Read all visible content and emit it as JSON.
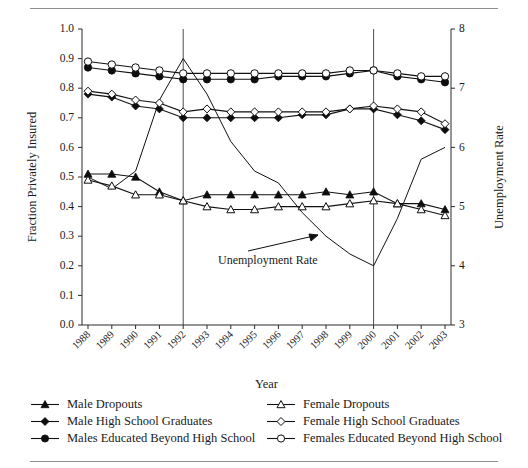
{
  "figure": {
    "rules": [
      "top-rule",
      "bottom-rule"
    ]
  },
  "chart_data": {
    "type": "line",
    "title": "",
    "xlabel": "Year",
    "ylabel": "Fraction Privately Insured",
    "y2label": "Unemployment Rate",
    "grid": false,
    "legend_position": "below",
    "categories": [
      "1988",
      "1989",
      "1990",
      "1991",
      "1992",
      "1993",
      "1994",
      "1995",
      "1996",
      "1997",
      "1998",
      "1999",
      "2000",
      "2001",
      "2002",
      "2003"
    ],
    "ylim": [
      0.0,
      1.0
    ],
    "yticks": [
      "0.0",
      "0.1",
      "0.2",
      "0.3",
      "0.4",
      "0.5",
      "0.6",
      "0.7",
      "0.8",
      "0.9",
      "1.0"
    ],
    "y2lim": [
      3,
      8
    ],
    "y2ticks": [
      "3",
      "4",
      "5",
      "6",
      "7",
      "8"
    ],
    "reference_lines": [
      {
        "name": "vline-1992",
        "x": "1992"
      },
      {
        "name": "vline-2000",
        "x": "2000"
      }
    ],
    "annotations": [
      {
        "name": "unemployment-rate-annotation",
        "text": "Unemployment Rate",
        "points_to": "1999"
      }
    ],
    "series": [
      {
        "name": "Male Dropouts",
        "key": "male-dropouts",
        "marker": "filled-triangle",
        "axis": "left",
        "values": [
          0.51,
          0.51,
          0.5,
          0.45,
          0.42,
          0.44,
          0.44,
          0.44,
          0.44,
          0.44,
          0.45,
          0.44,
          0.45,
          0.41,
          0.41,
          0.39
        ]
      },
      {
        "name": "Male High School Graduates",
        "key": "male-hs-graduates",
        "marker": "filled-diamond",
        "axis": "left",
        "values": [
          0.78,
          0.77,
          0.74,
          0.73,
          0.7,
          0.7,
          0.7,
          0.7,
          0.7,
          0.71,
          0.71,
          0.73,
          0.73,
          0.71,
          0.69,
          0.66
        ]
      },
      {
        "name": "Males Educated Beyond High School",
        "key": "males-beyond-hs",
        "marker": "filled-circle",
        "axis": "left",
        "values": [
          0.87,
          0.86,
          0.85,
          0.84,
          0.83,
          0.83,
          0.83,
          0.83,
          0.84,
          0.84,
          0.84,
          0.85,
          0.86,
          0.84,
          0.83,
          0.82
        ]
      },
      {
        "name": "Female Dropouts",
        "key": "female-dropouts",
        "marker": "open-triangle",
        "axis": "left",
        "values": [
          0.49,
          0.47,
          0.44,
          0.44,
          0.42,
          0.4,
          0.39,
          0.39,
          0.4,
          0.4,
          0.4,
          0.41,
          0.42,
          0.41,
          0.39,
          0.37
        ]
      },
      {
        "name": "Female High School Graduates",
        "key": "female-hs-graduates",
        "marker": "open-diamond",
        "axis": "left",
        "values": [
          0.79,
          0.78,
          0.76,
          0.75,
          0.72,
          0.73,
          0.72,
          0.72,
          0.72,
          0.72,
          0.72,
          0.73,
          0.74,
          0.73,
          0.72,
          0.68
        ]
      },
      {
        "name": "Females Educated Beyond High School",
        "key": "females-beyond-hs",
        "marker": "open-circle",
        "axis": "left",
        "values": [
          0.89,
          0.88,
          0.87,
          0.86,
          0.85,
          0.85,
          0.85,
          0.85,
          0.85,
          0.85,
          0.85,
          0.86,
          0.86,
          0.85,
          0.84,
          0.84
        ]
      },
      {
        "name": "Unemployment Rate",
        "key": "unemployment-rate",
        "marker": "none",
        "axis": "right",
        "values": [
          5.5,
          5.3,
          5.6,
          6.8,
          7.5,
          6.9,
          6.1,
          5.6,
          5.4,
          4.9,
          4.5,
          4.2,
          4.0,
          4.8,
          5.8,
          6.0
        ]
      }
    ]
  },
  "legend": {
    "items": [
      {
        "label": "Male Dropouts",
        "marker": "filled-triangle",
        "key": "male-dropouts"
      },
      {
        "label": "Female Dropouts",
        "marker": "open-triangle",
        "key": "female-dropouts"
      },
      {
        "label": "Male High School Graduates",
        "marker": "filled-diamond",
        "key": "male-hs-graduates"
      },
      {
        "label": "Female High School Graduates",
        "marker": "open-diamond",
        "key": "female-hs-graduates"
      },
      {
        "label": "Males Educated Beyond High School",
        "marker": "filled-circle",
        "key": "males-beyond-hs"
      },
      {
        "label": "Females Educated Beyond High School",
        "marker": "open-circle",
        "key": "females-beyond-hs"
      }
    ]
  },
  "colors": {
    "ink": "#111111",
    "axis": "#2a2a2a",
    "rule": "#8f8f8f",
    "marker_open_fill": "#ffffff"
  }
}
